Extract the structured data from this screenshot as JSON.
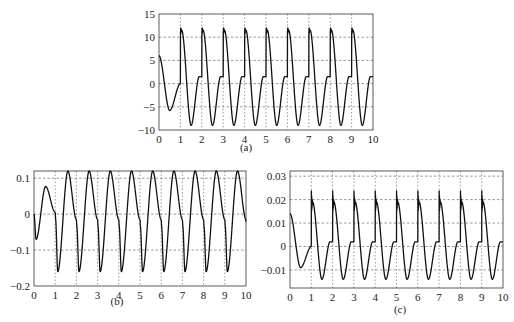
{
  "chart_data": [
    {
      "id": "a",
      "caption": "(a)",
      "type": "line",
      "title": "",
      "xlabel": "",
      "ylabel": "",
      "xlim": [
        0,
        10
      ],
      "ylim": [
        -10,
        15
      ],
      "xticks": [
        0,
        1,
        2,
        3,
        4,
        5,
        6,
        7,
        8,
        9,
        10
      ],
      "yticks": [
        -10,
        -5,
        0,
        5,
        10,
        15
      ],
      "ytick_labels": [
        "−10",
        "−5",
        "0",
        "5",
        "10",
        "15"
      ],
      "grid": true,
      "frame": {
        "left": 159,
        "top": 14,
        "right": 373,
        "bottom": 130
      },
      "caption_pos": {
        "x": 246,
        "y": 147
      },
      "series": [
        {
          "name": "waveform (a)",
          "period": 1,
          "first_cycle": {
            "start": 6,
            "min": -5.8,
            "min_t": 0.5,
            "end": 0
          },
          "cycle": {
            "spike_peak": 13.2,
            "ring_level": 11.5,
            "min": -9,
            "min_t": 0.5,
            "plateau": 1.5
          },
          "points": [
            [
              0,
              6
            ],
            [
              0.5,
              -5.8
            ],
            [
              0.95,
              0
            ],
            [
              1,
              13.2
            ],
            [
              1.5,
              -9
            ],
            [
              1.9,
              1.5
            ],
            [
              2,
              13.2
            ],
            [
              2.5,
              -9
            ],
            [
              2.9,
              1.5
            ],
            [
              3,
              13.2
            ],
            [
              3.5,
              -9
            ],
            [
              3.9,
              1.5
            ],
            [
              4,
              13.2
            ],
            [
              4.5,
              -9
            ],
            [
              4.9,
              1.5
            ],
            [
              5,
              13.2
            ],
            [
              5.5,
              -9
            ],
            [
              5.9,
              1.5
            ],
            [
              6,
              13.2
            ],
            [
              6.5,
              -9
            ],
            [
              6.9,
              1.5
            ],
            [
              7,
              13.2
            ],
            [
              7.5,
              -9
            ],
            [
              7.9,
              1.5
            ],
            [
              8,
              13.2
            ],
            [
              8.5,
              -9
            ],
            [
              8.9,
              1.5
            ],
            [
              9,
              13.2
            ],
            [
              9.5,
              -9
            ],
            [
              9.9,
              1.5
            ],
            [
              10,
              1.2
            ]
          ]
        }
      ]
    },
    {
      "id": "b",
      "caption": "(b)",
      "type": "line",
      "title": "",
      "xlabel": "",
      "ylabel": "",
      "xlim": [
        0,
        10
      ],
      "ylim": [
        -0.2,
        0.12
      ],
      "xticks": [
        0,
        1,
        2,
        3,
        4,
        5,
        6,
        7,
        8,
        9,
        10
      ],
      "yticks": [
        -0.2,
        -0.1,
        0,
        0.1
      ],
      "ytick_labels": [
        "−0.2",
        "−0.1",
        "0",
        "0.1"
      ],
      "grid": true,
      "frame": {
        "left": 34,
        "top": 171,
        "right": 246,
        "bottom": 286
      },
      "caption_pos": {
        "x": 117,
        "y": 301
      },
      "series": [
        {
          "name": "waveform (b)",
          "period": 1,
          "first_cycle": {
            "min": -0.07,
            "min_t": 0.1,
            "max": 0.077,
            "max_t": 0.55,
            "end": 0.005
          },
          "cycle": {
            "min": -0.16,
            "min_t": 0.12,
            "max": 0.12,
            "max_t": 0.6,
            "shoulder": -0.015
          },
          "points": [
            [
              0,
              0
            ],
            [
              0.1,
              -0.07
            ],
            [
              0.55,
              0.077
            ],
            [
              1,
              0.005
            ],
            [
              1.12,
              -0.155
            ],
            [
              1.6,
              0.12
            ],
            [
              1.95,
              -0.015
            ],
            [
              2.12,
              -0.16
            ],
            [
              2.6,
              0.12
            ],
            [
              2.95,
              -0.015
            ],
            [
              3.12,
              -0.16
            ],
            [
              3.6,
              0.12
            ],
            [
              3.95,
              -0.015
            ],
            [
              4.12,
              -0.16
            ],
            [
              4.6,
              0.12
            ],
            [
              4.95,
              -0.015
            ],
            [
              5.12,
              -0.16
            ],
            [
              5.6,
              0.12
            ],
            [
              5.95,
              -0.015
            ],
            [
              6.12,
              -0.16
            ],
            [
              6.6,
              0.12
            ],
            [
              6.95,
              -0.015
            ],
            [
              7.12,
              -0.16
            ],
            [
              7.6,
              0.12
            ],
            [
              7.95,
              -0.015
            ],
            [
              8.12,
              -0.16
            ],
            [
              8.6,
              0.12
            ],
            [
              8.95,
              -0.015
            ],
            [
              9.12,
              -0.16
            ],
            [
              9.6,
              0.12
            ],
            [
              10,
              -0.02
            ]
          ]
        }
      ]
    },
    {
      "id": "c",
      "caption": "(c)",
      "type": "line",
      "title": "",
      "xlabel": "",
      "ylabel": "",
      "xlim": [
        0,
        10
      ],
      "ylim": [
        -0.0177,
        0.0322
      ],
      "xticks": [
        0,
        1,
        2,
        3,
        4,
        5,
        6,
        7,
        8,
        9,
        10
      ],
      "yticks": [
        -0.01,
        0,
        0.01,
        0.02,
        0.03
      ],
      "ytick_labels": [
        "−0.01",
        "0",
        "0.01",
        "0.02",
        "0.03"
      ],
      "grid": true,
      "frame": {
        "left": 290,
        "top": 171,
        "right": 503,
        "bottom": 288
      },
      "caption_pos": {
        "x": 400,
        "y": 309
      },
      "series": [
        {
          "name": "waveform (c)",
          "period": 1,
          "first_cycle": {
            "start": 0.014,
            "min": -0.009,
            "min_t": 0.5,
            "end": 0
          },
          "cycle": {
            "spike_peak": 0.028,
            "ring_level": 0.019,
            "min": -0.014,
            "min_t": 0.5,
            "plateau": 0.002
          },
          "points": [
            [
              0,
              0.014
            ],
            [
              0.5,
              -0.009
            ],
            [
              0.95,
              0
            ],
            [
              1,
              0.028
            ],
            [
              1.5,
              -0.014
            ],
            [
              1.9,
              0.002
            ],
            [
              2,
              0.029
            ],
            [
              2.5,
              -0.014
            ],
            [
              2.9,
              0.002
            ],
            [
              3,
              0.029
            ],
            [
              3.5,
              -0.014
            ],
            [
              3.9,
              0.002
            ],
            [
              4,
              0.029
            ],
            [
              4.5,
              -0.014
            ],
            [
              4.9,
              0.002
            ],
            [
              5,
              0.029
            ],
            [
              5.5,
              -0.014
            ],
            [
              5.9,
              0.002
            ],
            [
              6,
              0.029
            ],
            [
              6.5,
              -0.014
            ],
            [
              6.9,
              0.002
            ],
            [
              7,
              0.029
            ],
            [
              7.5,
              -0.014
            ],
            [
              7.9,
              0.002
            ],
            [
              8,
              0.029
            ],
            [
              8.5,
              -0.014
            ],
            [
              8.9,
              0.002
            ],
            [
              9,
              0.029
            ],
            [
              9.5,
              -0.014
            ],
            [
              9.9,
              0.002
            ],
            [
              10,
              0.0015
            ]
          ]
        }
      ]
    }
  ]
}
